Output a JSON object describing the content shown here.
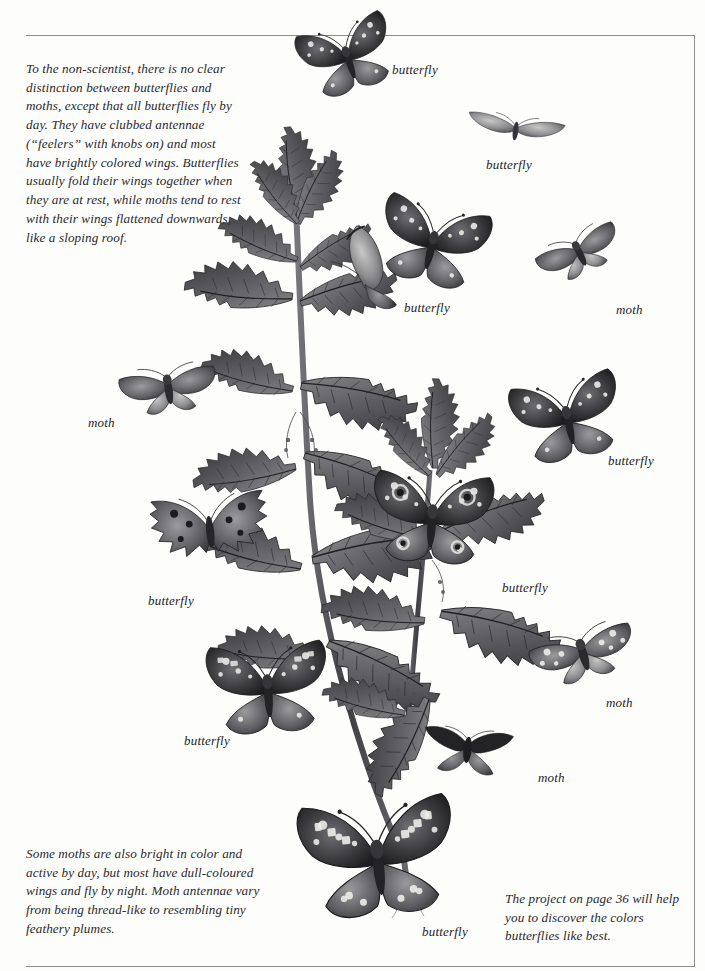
{
  "page": {
    "background_color": "#fdfdfc",
    "ink_color": "#2a2a2c",
    "rule_color": "#8d8d90",
    "width": 705,
    "height": 971
  },
  "text_blocks": {
    "intro": "To the non-scientist, there is no clear distinction between butterflies and moths, except that all butterflies fly by day. They have clubbed antennae (“feelers” with knobs on) and most have brightly colored wings. Butterflies usually fold their wings together when they are at rest, while moths tend to rest with their wings flattened downwards, like a sloping roof.",
    "moth_note": "Some moths are also bright in color and active by day, but most have dull-coloured wings and fly by night. Moth antennae vary from being thread-like to resembling tiny feathery plumes.",
    "project_note": "The project on page 36 will help you to discover the colors butterflies like best."
  },
  "captions": [
    {
      "id": "caption-1",
      "label": "butterfly",
      "x": 392,
      "y": 62
    },
    {
      "id": "caption-2",
      "label": "butterfly",
      "x": 486,
      "y": 157
    },
    {
      "id": "caption-3",
      "label": "butterfly",
      "x": 404,
      "y": 300
    },
    {
      "id": "caption-4",
      "label": "moth",
      "x": 616,
      "y": 302
    },
    {
      "id": "caption-5",
      "label": "moth",
      "x": 88,
      "y": 415
    },
    {
      "id": "caption-6",
      "label": "butterfly",
      "x": 608,
      "y": 453
    },
    {
      "id": "caption-7",
      "label": "butterfly",
      "x": 502,
      "y": 580
    },
    {
      "id": "caption-8",
      "label": "butterfly",
      "x": 148,
      "y": 593
    },
    {
      "id": "caption-9",
      "label": "moth",
      "x": 606,
      "y": 695
    },
    {
      "id": "caption-10",
      "label": "butterfly",
      "x": 184,
      "y": 733
    },
    {
      "id": "caption-11",
      "label": "moth",
      "x": 538,
      "y": 770
    },
    {
      "id": "caption-12",
      "label": "butterfly",
      "x": 422,
      "y": 924
    }
  ],
  "illustration": {
    "title": "butterflies-and-moths-on-stinging-nettle",
    "style": "grayscale engraving / halftone plate",
    "plant": "stinging nettle",
    "specimen_count": 12
  }
}
